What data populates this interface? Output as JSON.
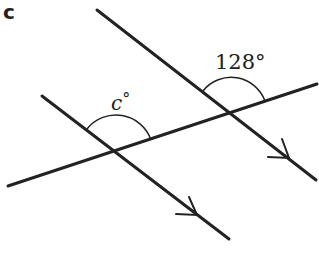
{
  "part_label": "c",
  "colors": {
    "line": "#222222",
    "background": "#ffffff"
  },
  "lines": {
    "transversal": {
      "x1": 8,
      "y1": 186,
      "x2": 317,
      "y2": 84
    },
    "parallel_left": {
      "x1": 42,
      "y1": 96,
      "x2": 229,
      "y2": 239,
      "arrow_at": [
        188,
        214
      ]
    },
    "parallel_right": {
      "x1": 97,
      "y1": 10,
      "x2": 316,
      "y2": 180,
      "arrow_at": [
        288,
        158
      ]
    }
  },
  "intersections": {
    "left": [
      116,
      151
    ],
    "right": [
      231,
      113
    ]
  },
  "angles": {
    "unknown": {
      "label": "c°",
      "variable": "c",
      "degree_symbol": "°"
    },
    "given": {
      "label": "128°",
      "value": 128
    }
  }
}
